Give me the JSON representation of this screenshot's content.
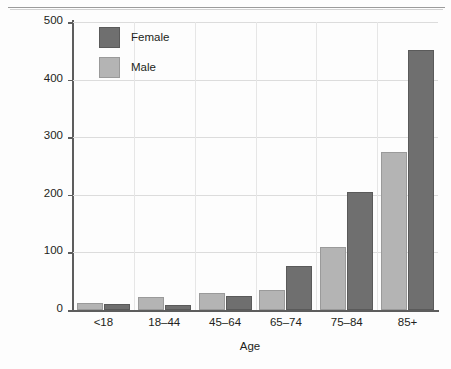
{
  "chart_data": {
    "type": "bar",
    "title": "",
    "subtitle": "",
    "xlabel": "Age",
    "ylabel": "Fractures diagnosed per 10,000 people in one year",
    "categories": [
      "<18",
      "18–44",
      "45–64",
      "65–74",
      "75–84",
      "85+"
    ],
    "series": [
      {
        "name": "Female",
        "color": "#6f6f6f",
        "values": [
          11,
          8,
          25,
          77,
          205,
          452
        ]
      },
      {
        "name": "Male",
        "color": "#b4b4b4",
        "values": [
          12,
          23,
          30,
          34,
          110,
          275
        ]
      }
    ],
    "ylim": [
      0,
      500
    ],
    "yticks": [
      0,
      100,
      200,
      300,
      400,
      500
    ],
    "ytick_labels": [
      "0",
      "100",
      "200",
      "300",
      "400",
      "500"
    ],
    "grid": "horizontal-and-vertical-light",
    "legend_position": "top-left-inside",
    "group_order_left_to_right": [
      "Male",
      "Female"
    ]
  },
  "legend": {
    "entries": [
      {
        "label": "Female",
        "swatch": "female"
      },
      {
        "label": "Male",
        "swatch": "male"
      }
    ]
  },
  "axes": {
    "x_title": "Age",
    "y_title": "Fractures diagnosed per 10,000 people in one year"
  }
}
